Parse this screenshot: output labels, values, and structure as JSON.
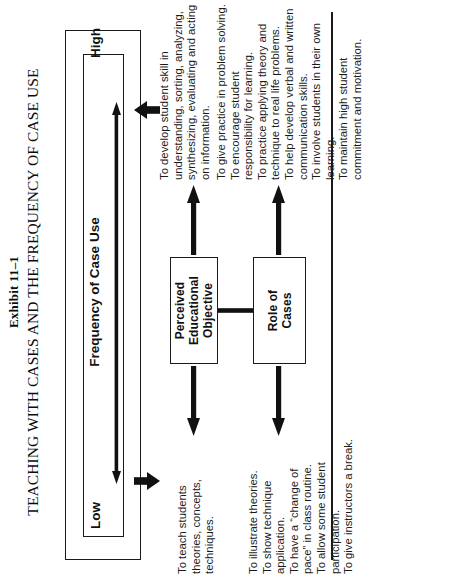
{
  "exhibit": {
    "number": "Exhibit 11–1",
    "title": "TEACHING WITH CASES AND THE FREQUENCY OF CASE USE"
  },
  "axis": {
    "title": "Frequency of Case Use",
    "low_label": "Low",
    "high_label": "High",
    "arrow_name": "double-headed-axis-arrow"
  },
  "nodes": {
    "perceived_educational_objective": "Perceived\nEducational\nObjective",
    "role_of_cases": "Role of\nCases"
  },
  "content": {
    "peo_low": "To teach students theories, concepts, techniques.",
    "peo_high": "To develop student skill in understanding, sorting, analyzing, synthesizing, evaluating and acting on information.",
    "roc_low_items": [
      "To illustrate theories.",
      "To show technique application.",
      "To have a “change of pace” in class routine.",
      "To allow some student participation.",
      "To give instructors a break."
    ],
    "roc_high_items": [
      "To give practice in problem solving.",
      "To encourage student responsibility for learning.",
      "To practice applying theory and technique to real life problems.",
      "To help develop verbal and written communication skills.",
      "To involve students in their own learning.",
      "To maintain high student commitment and motivation."
    ]
  },
  "colors": {
    "ink": "#1a1a1a",
    "background": "#ffffff"
  }
}
